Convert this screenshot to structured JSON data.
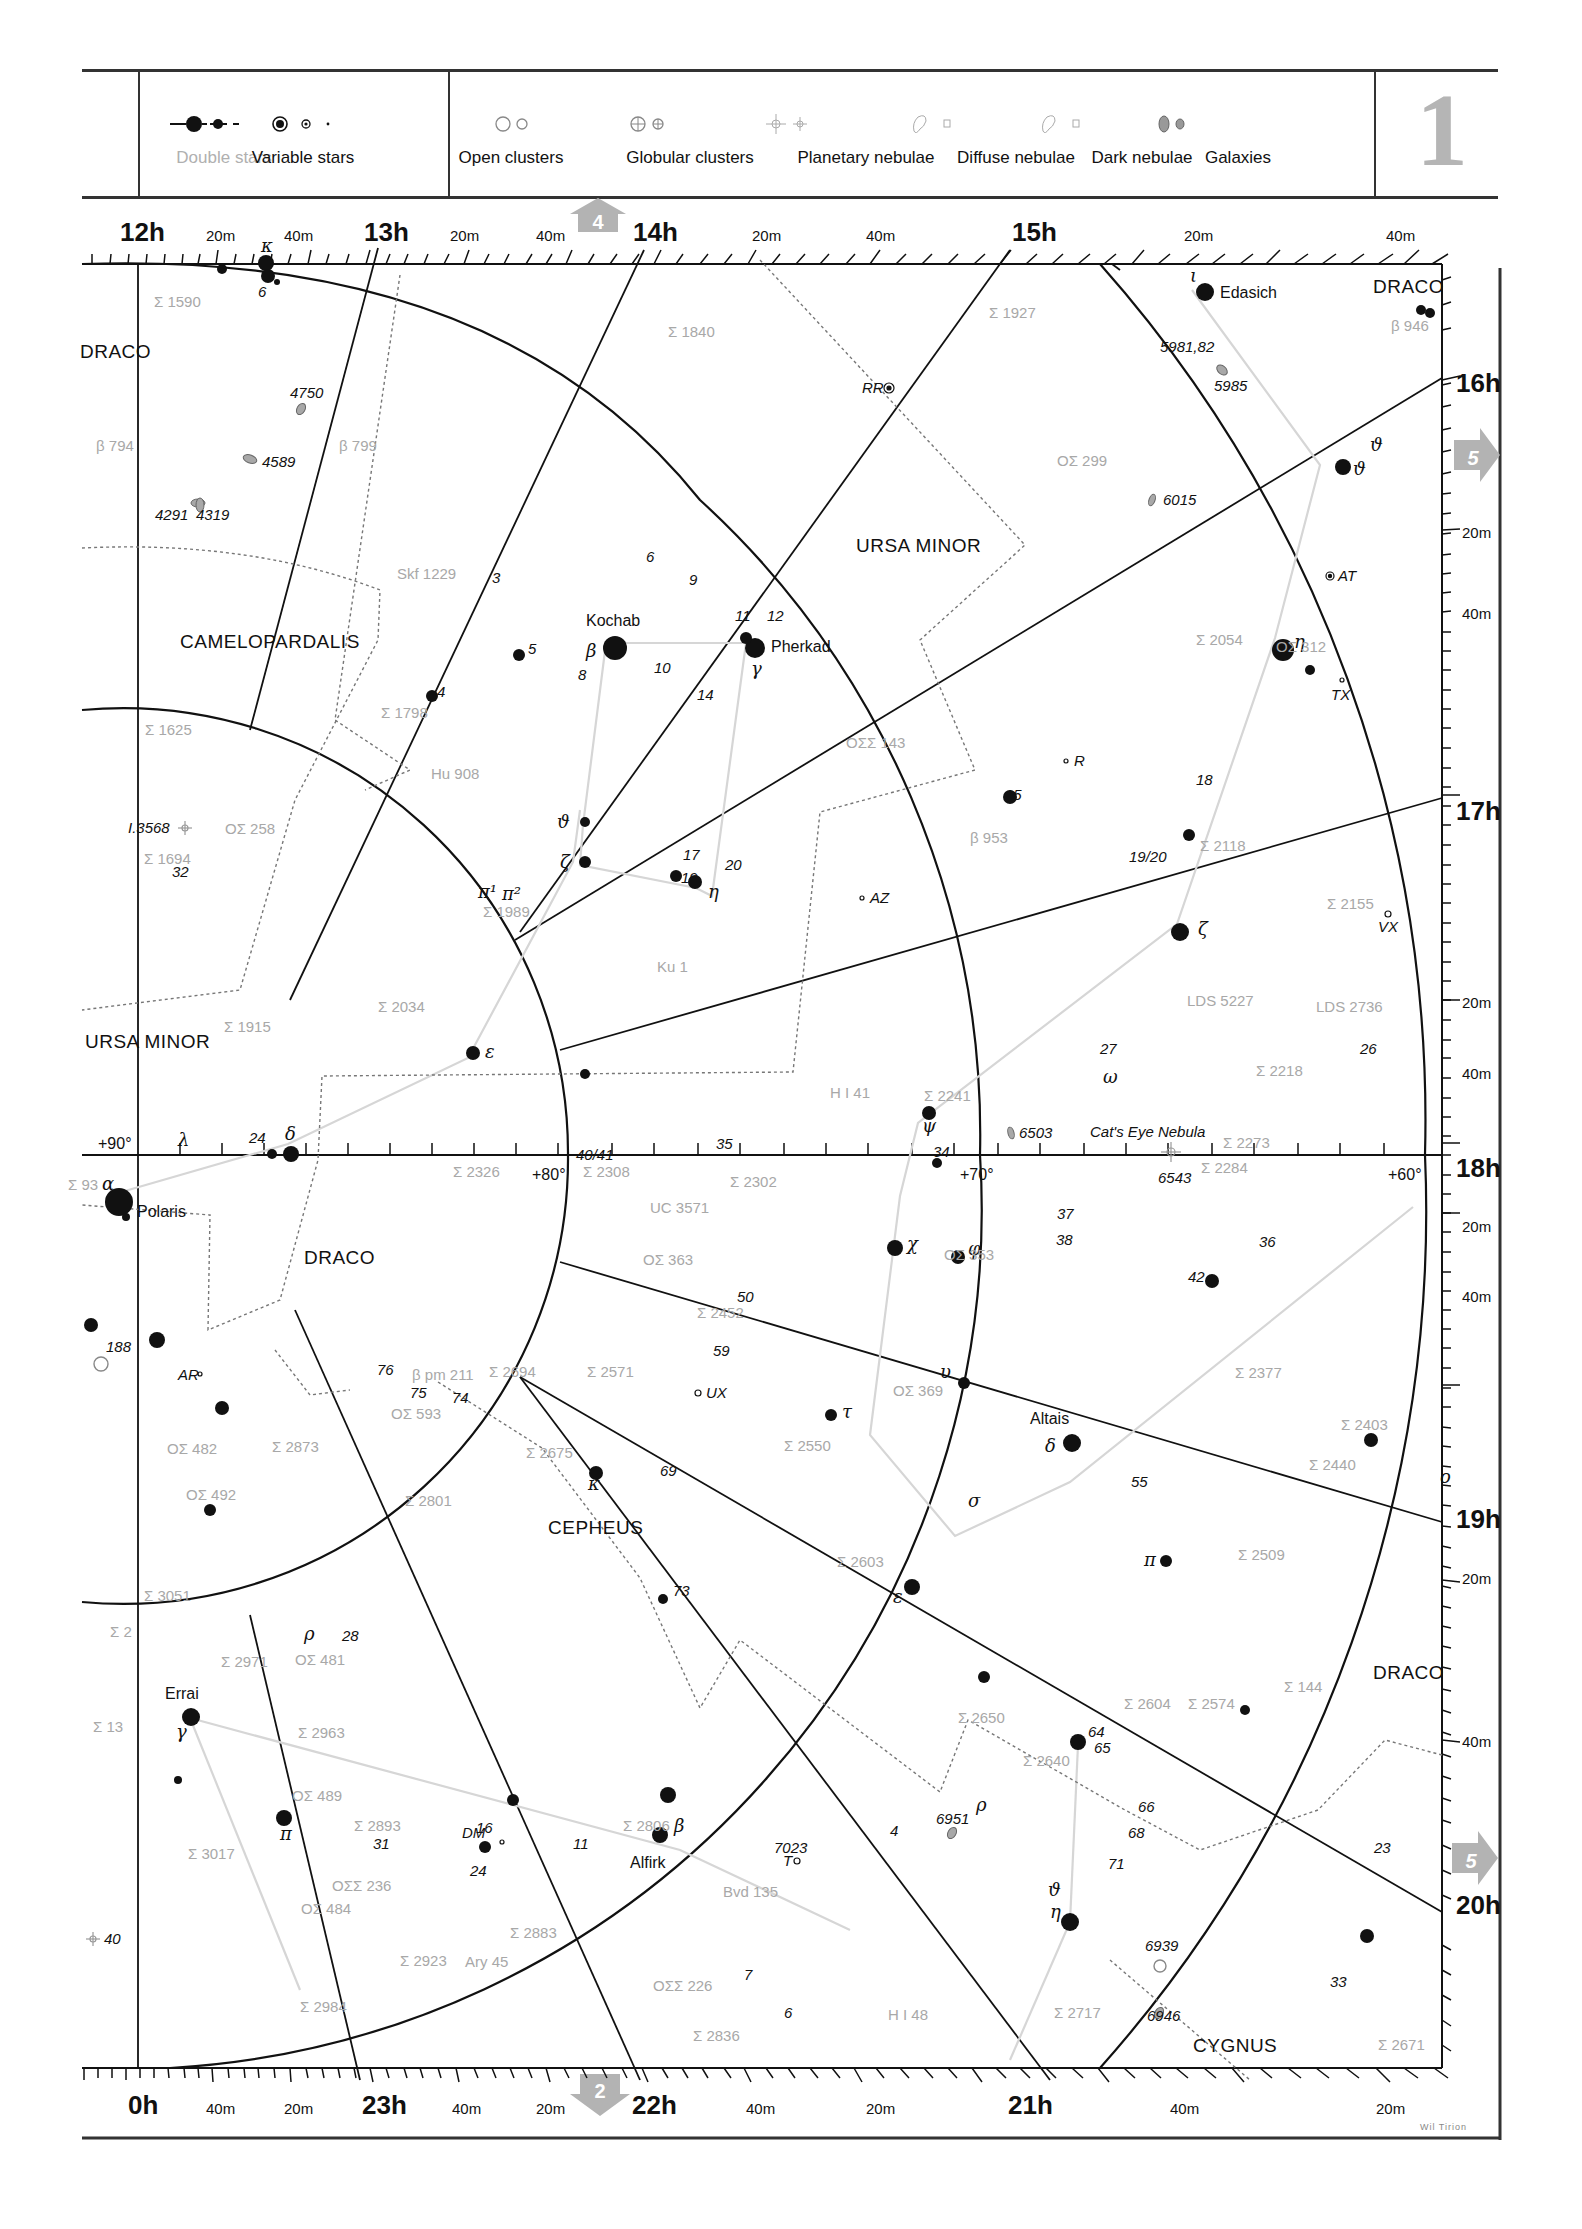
{
  "legend": {
    "items": [
      {
        "label": "Double stars",
        "icon": "double-star-icons",
        "muted": true
      },
      {
        "label": "Variable stars",
        "icon": "variable-star-icons"
      },
      {
        "label": "Open clusters",
        "icon": "open-cluster-icons"
      },
      {
        "label": "Globular clusters",
        "icon": "globular-cluster-icons"
      },
      {
        "label": "Planetary nebulae",
        "icon": "planetary-nebula-icons"
      },
      {
        "label": "Diffuse nebulae",
        "icon": "diffuse-nebula-icons"
      },
      {
        "label": "Dark nebulae",
        "icon": "dark-nebula-icons"
      },
      {
        "label": "Galaxies",
        "icon": "galaxy-icons"
      }
    ],
    "chart_number": "1"
  },
  "scales": {
    "top": [
      {
        "label": "12h",
        "major": true
      },
      {
        "label": "20m"
      },
      {
        "label": "40m"
      },
      {
        "label": "13h",
        "major": true
      },
      {
        "label": "20m"
      },
      {
        "label": "40m"
      },
      {
        "label": "14h",
        "major": true
      },
      {
        "label": "20m"
      },
      {
        "label": "40m"
      },
      {
        "label": "15h",
        "major": true
      },
      {
        "label": "20m"
      },
      {
        "label": "40m"
      }
    ],
    "right": [
      {
        "label": "16h",
        "major": true
      },
      {
        "label": "20m"
      },
      {
        "label": "40m"
      },
      {
        "label": "17h",
        "major": true
      },
      {
        "label": "20m"
      },
      {
        "label": "40m"
      },
      {
        "label": "18h",
        "major": true
      },
      {
        "label": "20m"
      },
      {
        "label": "40m"
      },
      {
        "label": "19h",
        "major": true
      },
      {
        "label": "20m"
      },
      {
        "label": "40m"
      },
      {
        "label": "20h",
        "major": true
      }
    ],
    "bottom": [
      {
        "label": "0h",
        "major": true
      },
      {
        "label": "40m"
      },
      {
        "label": "20m"
      },
      {
        "label": "23h",
        "major": true
      },
      {
        "label": "40m"
      },
      {
        "label": "20m"
      },
      {
        "label": "22h",
        "major": true
      },
      {
        "label": "40m"
      },
      {
        "label": "20m"
      },
      {
        "label": "21h",
        "major": true
      },
      {
        "label": "40m"
      },
      {
        "label": "20m"
      }
    ],
    "declination": [
      "+90°",
      "+80°",
      "+70°",
      "+60°"
    ]
  },
  "adjacent_charts": {
    "top": "4",
    "right_upper": "5",
    "right_lower": "5",
    "bottom": "2"
  },
  "constellations": [
    "DRACO",
    "CAMELOPARDALIS",
    "URSA MINOR",
    "URSA MINOR",
    "DRACO",
    "DRACO",
    "CEPHEUS",
    "DRACO",
    "CYGNUS"
  ],
  "star_names": [
    "Kochab",
    "Pherkad",
    "Edasich",
    "Polaris",
    "Altais",
    "Errai",
    "Alfirk"
  ],
  "objects": {
    "galaxies": [
      "4750",
      "4589",
      "4291",
      "4319",
      "5981,82",
      "5985",
      "6015",
      "6503",
      "6951",
      "6946"
    ],
    "planetary_nebulae": [
      "6543",
      "I.3568",
      "40"
    ],
    "open_clusters": [
      "188",
      "6939"
    ],
    "dark_nebulae": [
      "7023"
    ],
    "named": [
      "Cat's Eye Nebula"
    ]
  },
  "double_stars": [
    "Σ 1590",
    "β 794",
    "β 799",
    "Skf 1229",
    "Σ 1840",
    "Σ 1927",
    "β 946",
    "ΟΣ 299",
    "Σ 1625",
    "Σ 1798",
    "Hu 908",
    "ΟΣΣ 143",
    "Σ 2054",
    "ΟΣ 312",
    "OΣ 258",
    "Σ 1694",
    "Σ 1989",
    "β 953",
    "Σ 2118",
    "Σ 2155",
    "Ku 1",
    "LDS 5227",
    "LDS 2736",
    "Σ 1915",
    "Σ 2034",
    "H I 41",
    "Σ 2241",
    "Σ 2218",
    "Σ 2273",
    "Σ 2284",
    "Σ 93",
    "Σ 2326",
    "Σ 2308",
    "Σ 2302",
    "UC 3571",
    "ΟΣ 363",
    "ΟΣ 353",
    "Σ 2452",
    "Σ 2571",
    "Σ 2694",
    "β pm 211",
    "ΟΣ 593",
    "ΟΣ 369",
    "Σ 2377",
    "Σ 2403",
    "Σ 2440",
    "ΟΣ 482",
    "Σ 2873",
    "ΟΣ 492",
    "Σ 2675",
    "Σ 2550",
    "Σ 2801",
    "Σ 2603",
    "Σ 2509",
    "Σ 3051",
    "Σ 2",
    "Σ 2971",
    "ΟΣ 481",
    "Σ 2604",
    "Σ 2574",
    "Σ 144",
    "Σ 13",
    "Σ 2963",
    "Σ 2650",
    "Σ 2640",
    "ΟΣ 489",
    "Σ 2893",
    "Σ 2806",
    "Σ 3017",
    "ΟΣΣ 236",
    "ΟΣ 484",
    "Bvd 135",
    "Σ 2883",
    "Ary 45",
    "Σ 2923",
    "ΟΣΣ 226",
    "Σ 2984",
    "H I 48",
    "Σ 2836",
    "Σ 2717",
    "Σ 2671"
  ],
  "variable_stars": [
    "RR",
    "AT",
    "TX",
    "R",
    "AZ",
    "VX",
    "UX",
    "AR",
    "DM",
    "T"
  ],
  "credit": "Wil Tirion"
}
